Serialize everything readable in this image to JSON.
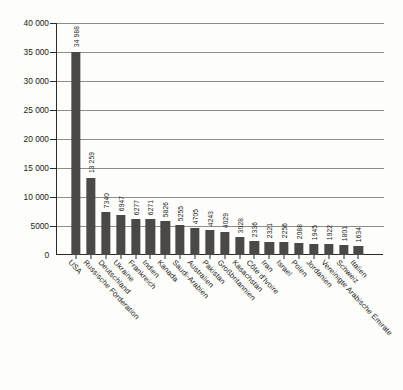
{
  "chart_data": {
    "type": "bar",
    "title": "",
    "subtitle": "",
    "xlabel": "",
    "ylabel": "",
    "ylim": [
      0,
      40000
    ],
    "grid": true,
    "legend": false,
    "orientation": "vertical",
    "bar_color": "#4b4945",
    "background_color": "#fdfdfb",
    "axis_color": "#2a2a28",
    "gridline_color": "#8d8d88",
    "ytick_labels": [
      "0",
      "5000",
      "10 000",
      "15 000",
      "20 000",
      "25 000",
      "30 000",
      "35 000",
      "40 000"
    ],
    "ytick_values": [
      0,
      5000,
      10000,
      15000,
      20000,
      25000,
      30000,
      35000,
      40000
    ],
    "categories": [
      "USA",
      "Russische Förderation",
      "Deutschland",
      "Ukraine",
      "Frankreich",
      "Indien",
      "Kanada",
      "Saudi-Arabien",
      "Australien",
      "Pakistan",
      "Großbritannien",
      "Kasachstan",
      "Côte d'Ivoire",
      "Iran",
      "Israel",
      "Polen",
      "Jordanien",
      "Vereinigte Arabische Emirate",
      "Schweiz",
      "Italien"
    ],
    "values": [
      34988,
      13259,
      7340,
      6947,
      6277,
      6271,
      5826,
      5255,
      4705,
      4243,
      4029,
      3028,
      2336,
      2321,
      2256,
      2088,
      1945,
      1922,
      1801,
      1634
    ],
    "value_labels": [
      "34 988",
      "13 259",
      "7340",
      "6947",
      "6277",
      "6271",
      "5826",
      "5255",
      "4705",
      "4243",
      "4029",
      "3028",
      "2336",
      "2321",
      "2256",
      "2088",
      "1945",
      "1922",
      "1801",
      "1634"
    ]
  }
}
